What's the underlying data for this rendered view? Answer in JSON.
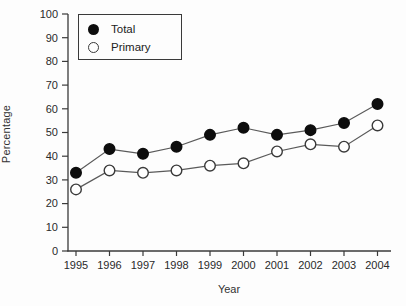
{
  "figure": {
    "background": "#fdfdfd",
    "axis_color": "#3a3a3a",
    "line_color": "#5a5a5a",
    "text_color": "#2a2a2a"
  },
  "chart_data": {
    "type": "line",
    "title": "",
    "xlabel": "Year",
    "ylabel": "Percentage",
    "x": [
      1995,
      1996,
      1997,
      1998,
      1999,
      2000,
      2001,
      2002,
      2003,
      2004
    ],
    "series": [
      {
        "name": "Total",
        "marker": "filled-circle",
        "marker_fill": "#0d0d0d",
        "marker_stroke": "#0d0d0d",
        "values": [
          33,
          43,
          41,
          44,
          49,
          52,
          49,
          51,
          54,
          62
        ]
      },
      {
        "name": "Primary",
        "marker": "open-circle",
        "marker_fill": "#ffffff",
        "marker_stroke": "#3a3a3a",
        "values": [
          26,
          34,
          33,
          34,
          36,
          37,
          42,
          45,
          44,
          53
        ]
      }
    ],
    "ylim": [
      0,
      100
    ],
    "yticks": [
      0,
      10,
      20,
      30,
      40,
      50,
      60,
      70,
      80,
      90,
      100
    ],
    "grid": false,
    "legend_position": "top-left"
  }
}
